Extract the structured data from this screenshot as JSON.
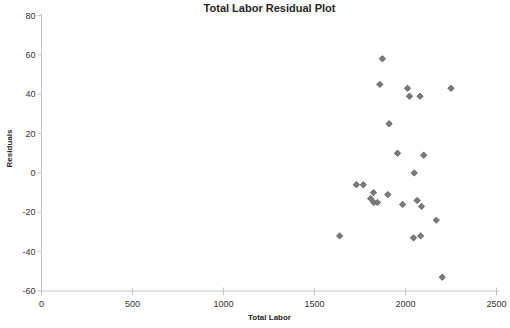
{
  "chart_data": {
    "type": "scatter",
    "title": "Total Labor Residual Plot",
    "xlabel": "Total Labor",
    "ylabel": "Residuals",
    "xlim": [
      0,
      2500
    ],
    "ylim": [
      -60,
      80
    ],
    "x_ticks": [
      0,
      500,
      1000,
      1500,
      2000,
      2500
    ],
    "y_ticks": [
      80,
      60,
      40,
      20,
      0,
      -20,
      -40,
      -60
    ],
    "grid": false,
    "legend": null,
    "marker": "diamond",
    "marker_color": "#7a7a7a",
    "marker_edge_color": "#5e5e5e",
    "axis_color": "#c3c3c3",
    "text_color": "#333333",
    "points": [
      {
        "x": 1873,
        "y": 58
      },
      {
        "x": 1859,
        "y": 45
      },
      {
        "x": 2011,
        "y": 43
      },
      {
        "x": 2022,
        "y": 39
      },
      {
        "x": 2080,
        "y": 39
      },
      {
        "x": 2250,
        "y": 43
      },
      {
        "x": 1910,
        "y": 25
      },
      {
        "x": 1956,
        "y": 10
      },
      {
        "x": 2100,
        "y": 9
      },
      {
        "x": 2048,
        "y": 0
      },
      {
        "x": 1730,
        "y": -6
      },
      {
        "x": 1768,
        "y": -6
      },
      {
        "x": 1824,
        "y": -10
      },
      {
        "x": 1808,
        "y": -13
      },
      {
        "x": 1826,
        "y": -15
      },
      {
        "x": 1846,
        "y": -15
      },
      {
        "x": 1903,
        "y": -11
      },
      {
        "x": 1984,
        "y": -16
      },
      {
        "x": 2064,
        "y": -14
      },
      {
        "x": 2088,
        "y": -17
      },
      {
        "x": 2169,
        "y": -24
      },
      {
        "x": 1638,
        "y": -32
      },
      {
        "x": 2044,
        "y": -33
      },
      {
        "x": 2083,
        "y": -32
      },
      {
        "x": 2202,
        "y": -53
      }
    ]
  }
}
